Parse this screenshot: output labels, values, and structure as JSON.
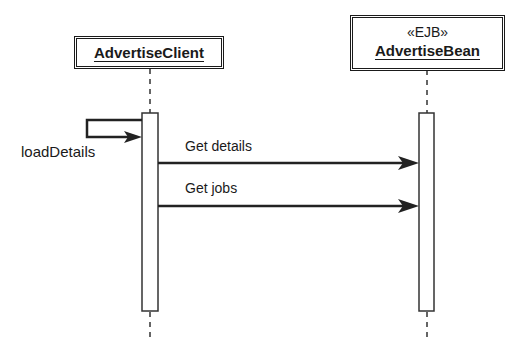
{
  "diagram": {
    "type": "sequence",
    "lifelines": [
      {
        "name": "AdvertiseClient",
        "stereotype": ""
      },
      {
        "name": "AdvertiseBean",
        "stereotype": "«EJB»"
      }
    ],
    "messages": [
      {
        "label": "loadDetails",
        "from": "AdvertiseClient",
        "to": "AdvertiseClient",
        "kind": "self"
      },
      {
        "label": "Get details",
        "from": "AdvertiseClient",
        "to": "AdvertiseBean"
      },
      {
        "label": "Get jobs",
        "from": "AdvertiseClient",
        "to": "AdvertiseBean"
      }
    ]
  }
}
